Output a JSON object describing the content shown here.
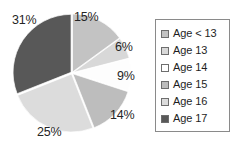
{
  "chart_data": {
    "type": "pie",
    "title": "",
    "subtitle": "",
    "xlabel": "",
    "ylabel": "",
    "grid": false,
    "legend_position": "right",
    "start_angle_deg": 0,
    "direction": "clockwise",
    "categories": [
      "Age < 13",
      "Age 13",
      "Age 14",
      "Age 15",
      "Age 16",
      "Age 17"
    ],
    "values": [
      15,
      6,
      9,
      14,
      25,
      31
    ],
    "value_unit": "%",
    "data_labels": [
      "15%",
      "6%",
      "9%",
      "14%",
      "25%",
      "31%"
    ],
    "colors": [
      "#c3c3c3",
      "#d8d8d8",
      "#fdfdfd",
      "#bdbdbd",
      "#dcdcdc",
      "#585858"
    ],
    "slices": [
      {
        "label": "Age < 13",
        "value": 15,
        "data_label": "15%",
        "color": "#c3c3c3"
      },
      {
        "label": "Age 13",
        "value": 6,
        "data_label": "6%",
        "color": "#d8d8d8"
      },
      {
        "label": "Age 14",
        "value": 9,
        "data_label": "9%",
        "color": "#fdfdfd"
      },
      {
        "label": "Age 15",
        "value": 14,
        "data_label": "14%",
        "color": "#bdbdbd"
      },
      {
        "label": "Age 16",
        "value": 25,
        "data_label": "25%",
        "color": "#dcdcdc"
      },
      {
        "label": "Age 17",
        "value": 31,
        "data_label": "31%",
        "color": "#585858"
      }
    ]
  },
  "legend": {
    "items": [
      {
        "label": "Age < 13",
        "color": "#c3c3c3"
      },
      {
        "label": "Age 13",
        "color": "#d8d8d8"
      },
      {
        "label": "Age 14",
        "color": "#ffffff"
      },
      {
        "label": "Age 15",
        "color": "#bdbdbd"
      },
      {
        "label": "Age 16",
        "color": "#dcdcdc"
      },
      {
        "label": "Age 17",
        "color": "#585858"
      }
    ]
  }
}
